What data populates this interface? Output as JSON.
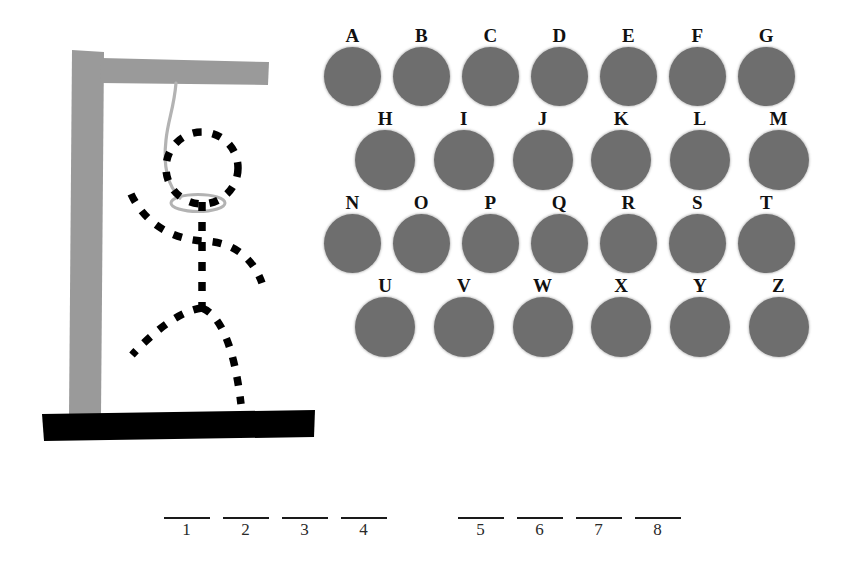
{
  "game": {
    "title": "Hangman",
    "state_label": "in-progress"
  },
  "gallows": {
    "post_color": "#9a9a9a",
    "beam_color": "#9a9a9a",
    "base_color": "#000000",
    "rope_color": "#b0b0b0",
    "figure_color": "#000000",
    "figure_style": "dashed",
    "parts": [
      {
        "name": "head",
        "revealed": false
      },
      {
        "name": "arms",
        "revealed": false
      },
      {
        "name": "body",
        "revealed": false
      },
      {
        "name": "legs",
        "revealed": false
      }
    ]
  },
  "keyboard": {
    "disc_color": "#6e6e6e",
    "rows": [
      {
        "letters": [
          "A",
          "B",
          "C",
          "D",
          "E",
          "F",
          "G"
        ]
      },
      {
        "letters": [
          "H",
          "I",
          "J",
          "K",
          "L",
          "M"
        ]
      },
      {
        "letters": [
          "N",
          "O",
          "P",
          "Q",
          "R",
          "S",
          "T"
        ]
      },
      {
        "letters": [
          "U",
          "V",
          "W",
          "X",
          "Y",
          "Z"
        ]
      }
    ]
  },
  "answer": {
    "words": [
      {
        "slots": [
          {
            "index": "1",
            "letter": ""
          },
          {
            "index": "2",
            "letter": ""
          },
          {
            "index": "3",
            "letter": ""
          },
          {
            "index": "4",
            "letter": ""
          }
        ]
      },
      {
        "slots": [
          {
            "index": "5",
            "letter": ""
          },
          {
            "index": "6",
            "letter": ""
          },
          {
            "index": "7",
            "letter": ""
          },
          {
            "index": "8",
            "letter": ""
          }
        ]
      }
    ]
  }
}
